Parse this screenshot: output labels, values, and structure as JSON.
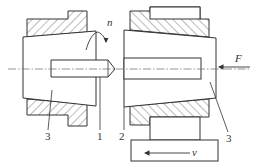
{
  "diagram": {
    "type": "mechanical-section-drawing",
    "colors": {
      "line": "#333333",
      "hatch": "#555555",
      "centerline": "#666666",
      "background": "#ffffff"
    },
    "labels": {
      "rotation": "n",
      "force": "F",
      "velocity": "v",
      "part_left_collet": "3",
      "part_workpiece": "1",
      "part_tool": "2",
      "part_right_collet": "3"
    }
  }
}
